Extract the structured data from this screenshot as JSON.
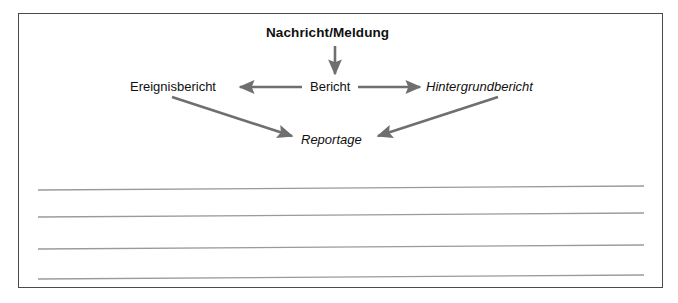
{
  "figure": {
    "frame_border_color": "#4a4a4a",
    "background_color": "#ffffff"
  },
  "diagram": {
    "type": "flow-hierarchy",
    "arrow_color": "#6f6f6f",
    "nodes": [
      {
        "id": "nachricht-meldung",
        "label": "Nachricht/Meldung",
        "style": "bold",
        "level": 0
      },
      {
        "id": "bericht",
        "label": "Bericht",
        "style": "regular",
        "level": 1
      },
      {
        "id": "ereignisbericht",
        "label": "Ereignisbericht",
        "style": "regular",
        "level": 2
      },
      {
        "id": "hintergrundbericht",
        "label": "Hintergrundbericht",
        "style": "italic",
        "level": 2
      },
      {
        "id": "reportage",
        "label": "Reportage",
        "style": "italic",
        "level": 3
      }
    ],
    "edges": [
      {
        "from": "nachricht-meldung",
        "to": "bericht",
        "direction": "down"
      },
      {
        "from": "bericht",
        "to": "ereignisbericht",
        "direction": "left"
      },
      {
        "from": "bericht",
        "to": "hintergrundbericht",
        "direction": "right"
      },
      {
        "from": "ereignisbericht",
        "to": "reportage",
        "direction": "down-right"
      },
      {
        "from": "hintergrundbericht",
        "to": "reportage",
        "direction": "down-left"
      }
    ]
  },
  "ruled_lines": {
    "color": "#9a9a9a",
    "count": 4,
    "lines": [
      {
        "x1": 38,
        "y1": 190,
        "x2": 644,
        "y2": 186
      },
      {
        "x1": 38,
        "y1": 217,
        "x2": 644,
        "y2": 213
      },
      {
        "x1": 38,
        "y1": 249,
        "x2": 644,
        "y2": 245
      },
      {
        "x1": 38,
        "y1": 279,
        "x2": 644,
        "y2": 275
      }
    ]
  }
}
